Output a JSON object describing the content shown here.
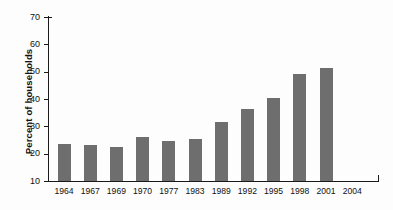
{
  "chart_data": {
    "type": "bar",
    "title": "",
    "xlabel": "",
    "ylabel": "Percent of households",
    "categories": [
      "1964",
      "1967",
      "1969",
      "1970",
      "1977",
      "1983",
      "1989",
      "1992",
      "1995",
      "1998",
      "2001",
      "2004"
    ],
    "values": [
      23.5,
      23.0,
      22.5,
      26.0,
      24.5,
      25.5,
      31.5,
      36.5,
      40.5,
      49.0,
      51.5,
      null
    ],
    "ytick_labels": [
      "10",
      "20",
      "30",
      "40",
      "50",
      "60",
      "70"
    ],
    "ytick_values": [
      10,
      20,
      30,
      40,
      50,
      60,
      70
    ],
    "ylim": [
      10,
      70
    ],
    "grid": false,
    "legend": false,
    "bar_color": "#6e6e6e",
    "axis_color": "#1a1a1a",
    "background": "#fdfdfd"
  }
}
